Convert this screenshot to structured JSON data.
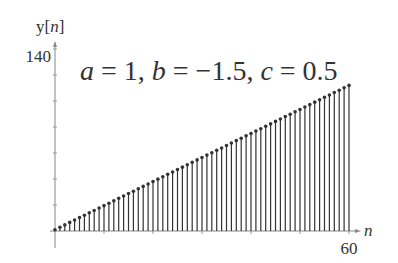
{
  "chart_data": {
    "type": "stem",
    "title": "a = 1, b = −1.5, c = 0.5",
    "title_parts": [
      {
        "var": "a",
        "eq": " = 1, "
      },
      {
        "var": "b",
        "eq": " = −1.5, "
      },
      {
        "var": "c",
        "eq": " = 0.5"
      }
    ],
    "xlabel": "n",
    "ylabel_prefix": "y[",
    "ylabel_var": "n",
    "ylabel_suffix": "]",
    "x_tick_labels": [
      {
        "value": 60,
        "label": "60"
      }
    ],
    "y_tick_labels": [
      {
        "value": 140,
        "label": "140"
      }
    ],
    "xlim": [
      0,
      60
    ],
    "ylim": [
      0,
      140
    ],
    "y_minor_tick_step": 20,
    "x_minor_tick_step": 10,
    "grid": false,
    "n_start": 0,
    "n_end": 60,
    "value_start": 1,
    "value_end": 112,
    "series": [
      {
        "name": "y[n]",
        "x": [
          0,
          1,
          2,
          3,
          4,
          5,
          6,
          7,
          8,
          9,
          10,
          11,
          12,
          13,
          14,
          15,
          16,
          17,
          18,
          19,
          20,
          21,
          22,
          23,
          24,
          25,
          26,
          27,
          28,
          29,
          30,
          31,
          32,
          33,
          34,
          35,
          36,
          37,
          38,
          39,
          40,
          41,
          42,
          43,
          44,
          45,
          46,
          47,
          48,
          49,
          50,
          51,
          52,
          53,
          54,
          55,
          56,
          57,
          58,
          59,
          60
        ],
        "values": [
          1,
          2.9,
          4.7,
          6.6,
          8.4,
          10.3,
          12.1,
          14,
          15.8,
          17.7,
          19.5,
          21.4,
          23.2,
          25.1,
          26.9,
          28.8,
          30.6,
          32.5,
          34.3,
          36.2,
          38,
          39.9,
          41.7,
          43.6,
          45.4,
          47.3,
          49.1,
          51,
          52.8,
          54.7,
          56.5,
          58.4,
          60.2,
          62.1,
          63.9,
          65.8,
          67.6,
          69.5,
          71.3,
          73.2,
          75,
          76.9,
          78.7,
          80.6,
          82.4,
          84.3,
          86.1,
          88,
          89.8,
          91.7,
          93.5,
          95.4,
          97.2,
          99.1,
          100.9,
          102.8,
          104.6,
          106.5,
          108.3,
          110.2,
          112
        ]
      }
    ],
    "colors": {
      "stem": "#333333",
      "axis": "#777777",
      "text": "#333333"
    }
  }
}
